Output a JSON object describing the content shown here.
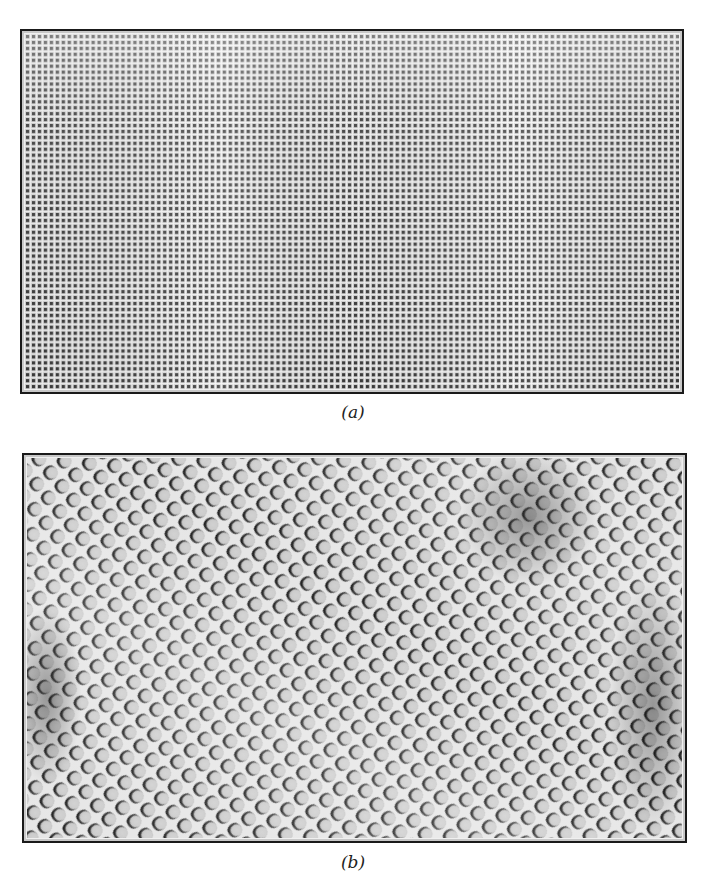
{
  "figure": {
    "panels": [
      {
        "id": "a",
        "label": "(a)",
        "description": "Fine square lattice pattern of dark dots on light background, slightly distorted near top",
        "pattern": "square-grid",
        "cell_period_px": 6,
        "colors": {
          "background": "#d4d4d4",
          "dot": "#3a3a3a",
          "line": "#f2f2f2"
        }
      },
      {
        "id": "b",
        "label": "(b)",
        "description": "Diagonal lattice of cells with crescent-shaped dark shading on upper-left edges; darker defect regions at upper right and right edge",
        "pattern": "diagonal-cell-lattice",
        "cell_period_px": 18,
        "colors": {
          "background": "#c4c4c4",
          "shadow": "#1e1e1e",
          "highlight": "#efefef"
        }
      }
    ]
  }
}
